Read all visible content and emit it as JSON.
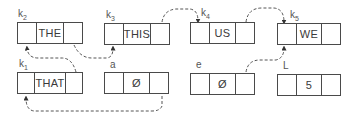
{
  "diagram": {
    "type": "linked-list-pointers",
    "nodes": [
      {
        "id": "k2",
        "label": "k",
        "sub": "2",
        "value": "THE",
        "x": 17,
        "y": 22,
        "w": 66
      },
      {
        "id": "k3",
        "label": "k",
        "sub": "3",
        "value": "THIS",
        "x": 104,
        "y": 23,
        "w": 66
      },
      {
        "id": "k4",
        "label": "k",
        "sub": "4",
        "value": "US",
        "x": 190,
        "y": 22,
        "w": 65
      },
      {
        "id": "k5",
        "label": "k",
        "sub": "5",
        "value": "WE",
        "x": 277,
        "y": 23,
        "w": 64
      },
      {
        "id": "k1",
        "label": "k",
        "sub": "1",
        "value": "THAT",
        "x": 17,
        "y": 72,
        "w": 66
      },
      {
        "id": "a",
        "label": "a",
        "sub": "",
        "value": "Ø",
        "x": 104,
        "y": 72,
        "w": 65
      },
      {
        "id": "e",
        "label": "e",
        "sub": "",
        "value": "Ø",
        "x": 190,
        "y": 73,
        "w": 65
      },
      {
        "id": "L",
        "label": "L",
        "sub": "",
        "value": "5",
        "x": 277,
        "y": 74,
        "w": 64
      }
    ],
    "edges": [
      {
        "from": "k2",
        "to": "k3"
      },
      {
        "from": "k3",
        "to": "k4"
      },
      {
        "from": "k4",
        "to": "k5"
      },
      {
        "from": "k1",
        "to": "k2"
      },
      {
        "from": "e",
        "to": "k5"
      },
      {
        "from": "a",
        "to": "k1"
      }
    ],
    "colors": {
      "line": "#4a4a4a",
      "text": "#3a3a3a"
    }
  }
}
